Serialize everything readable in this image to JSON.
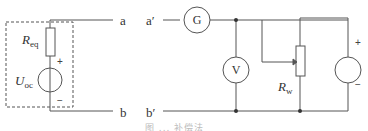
{
  "diagram": {
    "left_circuit": {
      "resistor_label": "R",
      "resistor_sub": "eq",
      "source_label": "U",
      "source_sub": "oc",
      "plus": "+",
      "minus": "−",
      "terminal_top": "a",
      "terminal_bottom": "b"
    },
    "right_circuit": {
      "terminal_top": "a′",
      "terminal_bottom": "b′",
      "galvanometer": "G",
      "voltmeter": "V",
      "rheostat_label": "R",
      "rheostat_sub": "w",
      "source_plus": "+",
      "source_minus": "−"
    },
    "caption": "图 ... 补偿法"
  }
}
